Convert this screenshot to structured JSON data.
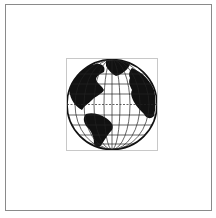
{
  "canvas": {
    "background": "#ffffff",
    "frame_color": "#8a8a8a"
  },
  "selection": {
    "border_color": "#c8c8c8"
  },
  "globe": {
    "icon": "globe-icon",
    "land_color": "#111111",
    "ocean_color": "#ffffff",
    "grid_color": "#222222",
    "view": "Atlantic hemisphere"
  }
}
